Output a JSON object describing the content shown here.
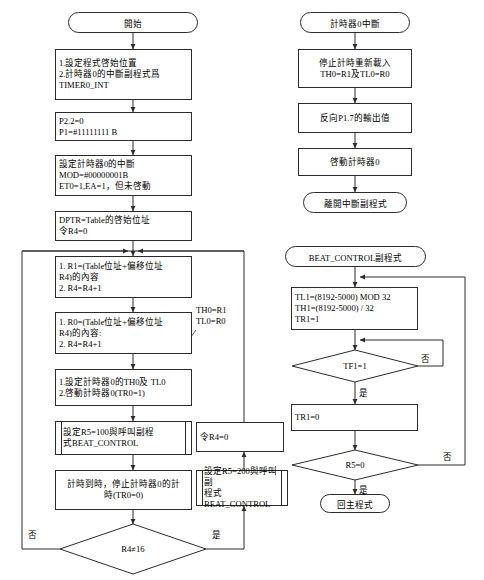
{
  "diagram": {
    "colors": {
      "stroke": "#2b2b2b",
      "background": "#ffffff",
      "text": "#000000"
    },
    "labels": {
      "yes": "是",
      "no": "否"
    }
  },
  "main_flow": {
    "start": "開始",
    "init_program": "1.設定程式啓始位置\n2.計時器0的中斷副程式爲\nTIMER0_INT",
    "port_init": "P2.2=0\nP1=#11111111 B",
    "timer_config": "設定計時器0的中斷\nMOD=#00000001B\nET0=1,EA=1，但未啓動",
    "dptr_init": "DPTR=Table的啓始位址\n令R4=0",
    "load_r1": "1. R1=(Table位址+偏移位址\nR4)的內容\n2. R4=R4+1",
    "load_r0": "1. R0=(Table位址+偏移位址\nR4)的內容:\n2. R4=R4+1",
    "set_timer": "1.設定計時器0的TH0及 TL0\n2.啓動計時器0(TR0=1)",
    "annotation": "TH0=R1\nTL0=R0",
    "call_beat_100": "設定R5=100與呼叫副程\n式BEAT_CONTROL",
    "stop_timer": "計時到時，停止計時器0的計\n時(TR0=0)",
    "decision_r4": "R4≠16",
    "reset_r4": "令R4=0",
    "call_beat_200": "設定R5=200與呼叫副\n程式BEAT_CONTROL"
  },
  "isr_flow": {
    "start": "計時器0中斷",
    "reload": "停止計時重新載入\nTH0=R1及TL0=R0",
    "toggle": "反向P1.7的輸出值",
    "restart": "啓動計時器0",
    "end": "離開中斷副程式"
  },
  "beat_control": {
    "start": "BEAT_CONTROL副程式",
    "load_timer1": "TL1=(8192-5000) MOD 32\nTH1=(8192-5000) / 32\nTR1=1",
    "decision_tf1": "TF1=1",
    "clear_tr1": "TR1=0",
    "decision_r5": "R5=0",
    "end": "回主程式"
  }
}
